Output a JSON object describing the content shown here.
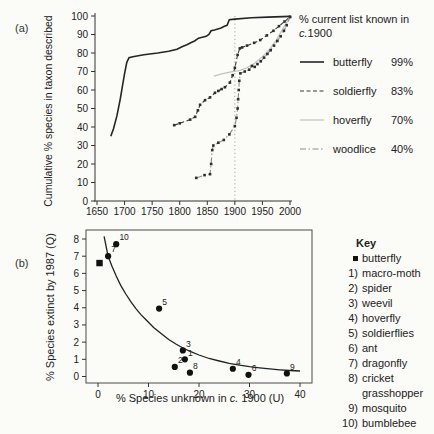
{
  "colors": {
    "axis": "#333333",
    "ref_line": "#9c9c9c",
    "curve": "#222222",
    "point": "#111111",
    "marker": "#2e2e2e"
  },
  "chart_data": [
    {
      "id": "a",
      "type": "line",
      "panel_label": "(a)",
      "ylabel": "Cumulative % species in taxon described",
      "xlabel": "",
      "xlim": [
        1650,
        2000
      ],
      "ylim": [
        0,
        100
      ],
      "x_ticks": [
        1650,
        1700,
        1750,
        1800,
        1850,
        1900,
        1950,
        2000
      ],
      "y_ticks": [
        0,
        10,
        20,
        30,
        40,
        50,
        60,
        70,
        80,
        90,
        100
      ],
      "ref_line_x": 1900,
      "grid": false,
      "legend_position": "right",
      "legend_title": {
        "line1": "% current list known in",
        "line2_italic": "c.",
        "line2_rest": "1900"
      },
      "series": [
        {
          "name": "butterfly",
          "known_1900": "99%",
          "color": "#252525",
          "dash": "none",
          "lw": 1.6,
          "markers": false,
          "points": [
            [
              1675,
              35
            ],
            [
              1680,
              39
            ],
            [
              1686,
              46
            ],
            [
              1692,
              55
            ],
            [
              1696,
              62
            ],
            [
              1700,
              69
            ],
            [
              1704,
              75
            ],
            [
              1708,
              77.5
            ],
            [
              1715,
              78
            ],
            [
              1735,
              79
            ],
            [
              1760,
              80
            ],
            [
              1780,
              81
            ],
            [
              1795,
              82
            ],
            [
              1805,
              83.5
            ],
            [
              1813,
              84.5
            ],
            [
              1820,
              85.5
            ],
            [
              1827,
              86.5
            ],
            [
              1834,
              88
            ],
            [
              1841,
              88.5
            ],
            [
              1848,
              89
            ],
            [
              1853,
              90
            ],
            [
              1857,
              92
            ],
            [
              1863,
              92.5
            ],
            [
              1869,
              93
            ],
            [
              1875,
              93.5
            ],
            [
              1881,
              94.5
            ],
            [
              1886,
              95
            ],
            [
              1890,
              98
            ],
            [
              1900,
              98.3
            ],
            [
              1930,
              99
            ],
            [
              1960,
              99.4
            ],
            [
              2000,
              99.8
            ]
          ]
        },
        {
          "name": "soldierfly",
          "known_1900": "83%",
          "color": "#3a3a3a",
          "dash": "4 2.5",
          "lw": 1.1,
          "markers": true,
          "points": [
            [
              1790,
              41
            ],
            [
              1800,
              42
            ],
            [
              1819,
              44
            ],
            [
              1828,
              45.5
            ],
            [
              1833,
              49
            ],
            [
              1837,
              52
            ],
            [
              1846,
              54.5
            ],
            [
              1855,
              56
            ],
            [
              1864,
              58.5
            ],
            [
              1870,
              59.5
            ],
            [
              1876,
              60.5
            ],
            [
              1882,
              61.5
            ],
            [
              1891,
              64
            ],
            [
              1896,
              68
            ],
            [
              1900,
              72
            ],
            [
              1905,
              79
            ],
            [
              1909,
              82.5
            ],
            [
              1913,
              83
            ],
            [
              1922,
              84
            ],
            [
              1935,
              85.5
            ],
            [
              1946,
              87
            ],
            [
              1958,
              89.5
            ],
            [
              1970,
              92
            ],
            [
              1980,
              94.5
            ],
            [
              1990,
              97
            ],
            [
              2000,
              99.5
            ]
          ]
        },
        {
          "name": "hoverfly",
          "known_1900": "70%",
          "color": "#c2c2c2",
          "dash": "none",
          "lw": 1.2,
          "markers": false,
          "points": [
            [
              1862,
              67.5
            ],
            [
              1878,
              68.8
            ],
            [
              1893,
              69.8
            ],
            [
              1908,
              70.5
            ],
            [
              1922,
              72
            ],
            [
              1936,
              74.5
            ],
            [
              1950,
              78
            ],
            [
              1963,
              82
            ],
            [
              1975,
              87
            ],
            [
              1987,
              93
            ],
            [
              2000,
              99.5
            ]
          ]
        },
        {
          "name": "woodlice",
          "known_1900": "40%",
          "color": "#8c8c8c",
          "dash": "6 2.5 1.5 2.5",
          "lw": 1.1,
          "markers": true,
          "points": [
            [
              1830,
              12.5
            ],
            [
              1845,
              14
            ],
            [
              1855,
              14.5
            ],
            [
              1857,
              20
            ],
            [
              1859,
              27.5
            ],
            [
              1861,
              30
            ],
            [
              1870,
              31.5
            ],
            [
              1880,
              33
            ],
            [
              1890,
              36
            ],
            [
              1900,
              40.5
            ],
            [
              1903,
              45
            ],
            [
              1905,
              50
            ],
            [
              1906,
              55
            ],
            [
              1907,
              60
            ],
            [
              1908,
              65
            ],
            [
              1910,
              69
            ],
            [
              1918,
              70
            ],
            [
              1926,
              71
            ],
            [
              1931,
              73
            ],
            [
              1936,
              72.5
            ],
            [
              1941,
              74
            ],
            [
              1947,
              75.5
            ],
            [
              1953,
              77.5
            ],
            [
              1959,
              79.5
            ],
            [
              1965,
              81.5
            ],
            [
              1971,
              84
            ],
            [
              1977,
              86.5
            ],
            [
              1983,
              89
            ],
            [
              1989,
              92
            ],
            [
              1994,
              95
            ],
            [
              2000,
              99.5
            ]
          ]
        }
      ]
    },
    {
      "id": "b",
      "type": "scatter",
      "panel_label": "(b)",
      "ylabel": "% Species extinct by 1987 (Q)",
      "xlabel_pre": "% Species unknown in ",
      "xlabel_italic": "c.",
      "xlabel_post": " 1900 (U)",
      "xlim": [
        0,
        40
      ],
      "ylim": [
        0,
        8
      ],
      "x_ticks": [
        0,
        10,
        20,
        30,
        40
      ],
      "y_ticks": [
        0,
        1,
        2,
        3,
        4,
        5,
        6,
        7,
        8
      ],
      "grid": false,
      "box": true,
      "curve": [
        [
          1.2,
          8.15
        ],
        [
          2,
          7.0
        ],
        [
          2.8,
          6.4
        ],
        [
          3.6,
          5.85
        ],
        [
          4.5,
          5.3
        ],
        [
          5.5,
          4.8
        ],
        [
          6.5,
          4.35
        ],
        [
          7.5,
          3.95
        ],
        [
          8.5,
          3.6
        ],
        [
          9.5,
          3.3
        ],
        [
          11,
          2.85
        ],
        [
          12.5,
          2.5
        ],
        [
          14,
          2.15
        ],
        [
          15.5,
          1.88
        ],
        [
          17,
          1.63
        ],
        [
          18.5,
          1.43
        ],
        [
          20,
          1.25
        ],
        [
          22,
          1.05
        ],
        [
          24,
          0.9
        ],
        [
          26,
          0.77
        ],
        [
          28,
          0.66
        ],
        [
          30,
          0.57
        ],
        [
          32,
          0.5
        ],
        [
          34,
          0.44
        ],
        [
          36,
          0.39
        ],
        [
          38,
          0.35
        ],
        [
          40,
          0.32
        ]
      ],
      "points": [
        {
          "label": "butterfly",
          "marker": "square",
          "x": 0.3,
          "y": 6.6,
          "tag": ""
        },
        {
          "label": "macro-moth",
          "marker": "circle",
          "x": 17.2,
          "y": 1.0,
          "tag": "1"
        },
        {
          "label": "spider",
          "marker": "circle",
          "x": 15.2,
          "y": 0.56,
          "tag": "2"
        },
        {
          "label": "weevil",
          "marker": "circle",
          "x": 16.8,
          "y": 1.52,
          "tag": "3"
        },
        {
          "label": "hoverfly",
          "marker": "circle",
          "x": 26.7,
          "y": 0.45,
          "tag": "4"
        },
        {
          "label": "soldierflies",
          "marker": "circle",
          "x": 12.1,
          "y": 3.95,
          "tag": "5"
        },
        {
          "label": "ant",
          "marker": "circle",
          "x": 29.8,
          "y": 0.1,
          "tag": "6"
        },
        {
          "label": "dragonfly",
          "marker": "circle",
          "x": 2.0,
          "y": 7.0,
          "tag": "7"
        },
        {
          "label": "cricket grasshopper",
          "marker": "circle",
          "x": 18.2,
          "y": 0.22,
          "tag": "8"
        },
        {
          "label": "mosquito",
          "marker": "circle",
          "x": 37.4,
          "y": 0.18,
          "tag": "9"
        },
        {
          "label": "bumblebee",
          "marker": "circle",
          "x": 3.6,
          "y": 7.7,
          "tag": "10"
        }
      ],
      "key_title": "Key",
      "key_items": [
        {
          "num": "",
          "label": "butterfly",
          "marker": "square"
        },
        {
          "num": "1)",
          "label": "macro-moth"
        },
        {
          "num": "2)",
          "label": "spider"
        },
        {
          "num": "3)",
          "label": "weevil"
        },
        {
          "num": "4)",
          "label": "hoverfly"
        },
        {
          "num": "5)",
          "label": "soldierflies"
        },
        {
          "num": "6)",
          "label": "ant"
        },
        {
          "num": "7)",
          "label": "dragonfly"
        },
        {
          "num": "8)",
          "label": "cricket grasshopper"
        },
        {
          "num": "9)",
          "label": "mosquito"
        },
        {
          "num": "10)",
          "label": "bumblebee"
        }
      ]
    }
  ]
}
